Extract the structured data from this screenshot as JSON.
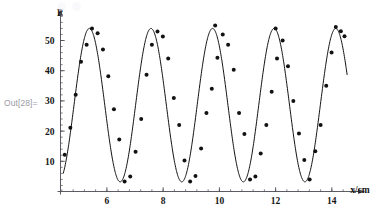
{
  "notebook": {
    "out_label": "Out[28]="
  },
  "chart_data": {
    "type": "scatter",
    "title": "",
    "subtitle": "",
    "xlabel": "x/cm",
    "ylabel": "P",
    "xlim": [
      4.35,
      14.95
    ],
    "ylim": [
      0.0,
      58.0
    ],
    "grid": false,
    "legend": null,
    "axis_style": "mathematica-arrow-axes",
    "xticks": [
      6,
      8,
      10,
      12,
      14
    ],
    "xtick_labels": [
      "6",
      "8",
      "10",
      "12",
      "14"
    ],
    "yticks": [
      10,
      20,
      30,
      40,
      50
    ],
    "ytick_labels": [
      "10",
      "20",
      "30",
      "40",
      "50"
    ],
    "x_minor_tick_step": 0.4,
    "y_minor_tick_step": 2,
    "marker": {
      "shape": "circle",
      "color": "#121212",
      "size_px": 4.0
    },
    "fit": {
      "kind": "sinusoid",
      "color": "#121212",
      "line_width": 1.0,
      "equation": "P = offset + amplitude * sin(2*pi*(x - phase)/period)",
      "offset": 28.6,
      "amplitude": 25.4,
      "period": 2.19,
      "phase": 4.83,
      "x_start": 4.45,
      "x_end": 14.55
    },
    "annotations": [],
    "points": [
      {
        "x": 4.5,
        "y": 12.2
      },
      {
        "x": 4.7,
        "y": 21.1
      },
      {
        "x": 4.89,
        "y": 32.0
      },
      {
        "x": 5.08,
        "y": 43.0
      },
      {
        "x": 5.28,
        "y": 48.6
      },
      {
        "x": 5.47,
        "y": 54.0
      },
      {
        "x": 5.67,
        "y": 52.4
      },
      {
        "x": 5.86,
        "y": 47.0
      },
      {
        "x": 6.05,
        "y": 38.2
      },
      {
        "x": 6.25,
        "y": 27.2
      },
      {
        "x": 6.44,
        "y": 17.2
      },
      {
        "x": 6.63,
        "y": 3.3
      },
      {
        "x": 6.83,
        "y": 5.0
      },
      {
        "x": 7.02,
        "y": 13.2
      },
      {
        "x": 7.22,
        "y": 24.0
      },
      {
        "x": 7.41,
        "y": 38.7
      },
      {
        "x": 7.6,
        "y": 48.6
      },
      {
        "x": 7.8,
        "y": 53.0
      },
      {
        "x": 7.99,
        "y": 51.3
      },
      {
        "x": 8.18,
        "y": 44.0
      },
      {
        "x": 8.38,
        "y": 31.0
      },
      {
        "x": 8.57,
        "y": 22.0
      },
      {
        "x": 8.76,
        "y": 10.3
      },
      {
        "x": 8.96,
        "y": 3.3
      },
      {
        "x": 9.15,
        "y": 5.1
      },
      {
        "x": 9.35,
        "y": 14.2
      },
      {
        "x": 9.54,
        "y": 26.0
      },
      {
        "x": 9.73,
        "y": 34.0
      },
      {
        "x": 9.85,
        "y": 55.0
      },
      {
        "x": 9.93,
        "y": 44.3
      },
      {
        "x": 10.12,
        "y": 52.0
      },
      {
        "x": 10.31,
        "y": 48.6
      },
      {
        "x": 10.51,
        "y": 40.3
      },
      {
        "x": 10.7,
        "y": 26.0
      },
      {
        "x": 10.89,
        "y": 19.0
      },
      {
        "x": 11.09,
        "y": 4.0
      },
      {
        "x": 11.28,
        "y": 5.0
      },
      {
        "x": 11.47,
        "y": 12.6
      },
      {
        "x": 11.67,
        "y": 22.0
      },
      {
        "x": 11.86,
        "y": 33.0
      },
      {
        "x": 12.0,
        "y": 54.0
      },
      {
        "x": 12.05,
        "y": 44.0
      },
      {
        "x": 12.25,
        "y": 50.0
      },
      {
        "x": 12.44,
        "y": 41.5
      },
      {
        "x": 12.63,
        "y": 30.0
      },
      {
        "x": 12.83,
        "y": 19.2
      },
      {
        "x": 13.02,
        "y": 10.4
      },
      {
        "x": 13.21,
        "y": 4.0
      },
      {
        "x": 13.41,
        "y": 13.3
      },
      {
        "x": 13.6,
        "y": 22.0
      },
      {
        "x": 13.8,
        "y": 35.0
      },
      {
        "x": 13.99,
        "y": 46.0
      },
      {
        "x": 14.14,
        "y": 54.5
      },
      {
        "x": 14.32,
        "y": 53.1
      },
      {
        "x": 14.45,
        "y": 51.4
      }
    ]
  }
}
